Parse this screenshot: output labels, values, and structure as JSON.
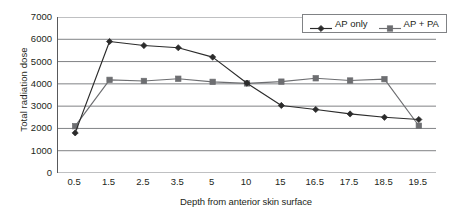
{
  "chart_data": {
    "type": "line",
    "title": "",
    "xlabel": "Depth from anterior skin surface",
    "ylabel": "Total radiation dose",
    "categories": [
      "0.5",
      "1.5",
      "2.5",
      "3.5",
      "5",
      "10",
      "15",
      "16.5",
      "17.5",
      "18.5",
      "19.5"
    ],
    "ylim": [
      0,
      7000
    ],
    "yticks": [
      0,
      1000,
      2000,
      3000,
      4000,
      5000,
      6000,
      7000
    ],
    "ytick_labels": [
      "0",
      "1000",
      "2000",
      "3000",
      "4000",
      "5000",
      "6000",
      "7000"
    ],
    "grid": "horizontal",
    "legend_position": "top-right-inside",
    "series": [
      {
        "name": "AP only",
        "marker": "diamond",
        "color": "#2b2b2b",
        "values": [
          1800,
          5900,
          5720,
          5620,
          5200,
          4030,
          3030,
          2850,
          2650,
          2500,
          2400
        ]
      },
      {
        "name": "AP + PA",
        "marker": "square",
        "color": "#6d6e71",
        "values": [
          2100,
          4180,
          4130,
          4230,
          4090,
          4020,
          4100,
          4250,
          4150,
          4210,
          2120
        ]
      }
    ]
  },
  "colors": {
    "axis": "#58595b",
    "gridline": "#808285",
    "series_ap_only": "#2b2b2b",
    "series_ap_pa": "#6d6e71",
    "background": "#ffffff",
    "text": "#231f20"
  }
}
